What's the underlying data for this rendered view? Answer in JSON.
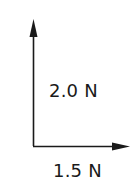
{
  "diagram": {
    "type": "force-vector-diagram",
    "vectors": [
      {
        "name": "vertical-force",
        "direction": "up",
        "magnitude_label": "2.0 N",
        "magnitude": 2.0,
        "unit": "N"
      },
      {
        "name": "horizontal-force",
        "direction": "right",
        "magnitude_label": "1.5 N",
        "magnitude": 1.5,
        "unit": "N"
      }
    ],
    "colors": {
      "arrow": "#1a1a1a",
      "text": "#1a1a1a",
      "background": "#ffffff"
    }
  }
}
